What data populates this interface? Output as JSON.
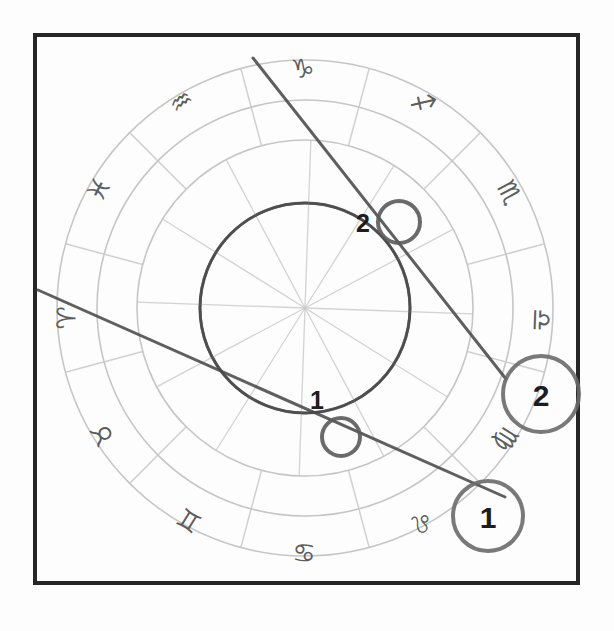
{
  "chart_data": {
    "type": "scatter",
    "subtitle": "Zodiac wheel with two aspect lines and four numbered position markers",
    "xlabel": "",
    "ylabel": "",
    "grid": true,
    "legend": "none",
    "center": {
      "x": 305,
      "y": 308
    },
    "rings": [
      {
        "name": "outer-zodiac-ring",
        "radius": 248
      },
      {
        "name": "inner-zodiac-ring",
        "radius": 208
      },
      {
        "name": "house-ring",
        "radius": 168
      },
      {
        "name": "inner-aspect-circle",
        "radius": 105
      }
    ],
    "spoke_count": 12,
    "signs": [
      {
        "name": "Capricorn",
        "glyph": "♑",
        "angle_deg": 90,
        "x": 303,
        "y": 70,
        "rotate": -5
      },
      {
        "name": "Aquarius",
        "glyph": "♒",
        "angle_deg": 120,
        "x": 182,
        "y": 103,
        "rotate": -35
      },
      {
        "name": "Pisces",
        "glyph": "♓",
        "angle_deg": 150,
        "x": 100,
        "y": 190,
        "rotate": -62
      },
      {
        "name": "Aries",
        "glyph": "♈",
        "angle_deg": 180,
        "x": 68,
        "y": 318,
        "rotate": -88
      },
      {
        "name": "Taurus",
        "glyph": "♉",
        "angle_deg": 210,
        "x": 104,
        "y": 434,
        "rotate": -118
      },
      {
        "name": "Gemini",
        "glyph": "♊",
        "angle_deg": 240,
        "x": 190,
        "y": 519,
        "rotate": -148
      },
      {
        "name": "Cancer",
        "glyph": "♋",
        "angle_deg": 270,
        "x": 304,
        "y": 551,
        "rotate": -178
      },
      {
        "name": "Leo",
        "glyph": "♌",
        "angle_deg": 300,
        "x": 421,
        "y": 521,
        "rotate": -208
      },
      {
        "name": "Virgo",
        "glyph": "♍",
        "angle_deg": 330,
        "x": 505,
        "y": 438,
        "rotate": -238
      },
      {
        "name": "Libra",
        "glyph": "♎",
        "angle_deg": 0,
        "x": 540,
        "y": 320,
        "rotate": -268
      },
      {
        "name": "Scorpio",
        "glyph": "♏",
        "angle_deg": 30,
        "x": 508,
        "y": 193,
        "rotate": -298
      },
      {
        "name": "Sagittarius",
        "glyph": "♐",
        "angle_deg": 60,
        "x": 422,
        "y": 104,
        "rotate": -328
      }
    ],
    "aspect_lines": [
      {
        "name": "aspect-line-2",
        "label": "2",
        "x1": 253,
        "y1": 58,
        "x2": 506,
        "y2": 379,
        "color": "#4a4a4a",
        "width": 3
      },
      {
        "name": "aspect-line-1",
        "label": "1",
        "x1": 38,
        "y1": 290,
        "x2": 505,
        "y2": 497,
        "color": "#4a4a4a",
        "width": 3
      }
    ],
    "orbit_arc": {
      "name": "planet-orbit-arc",
      "cx": 305,
      "cy": 308,
      "r": 105,
      "color": "#4a4a4a",
      "width": 3
    },
    "markers": [
      {
        "id": "marker-inner-2",
        "label": "2",
        "cx": 399,
        "cy": 222,
        "radius": 21,
        "label_x": 363,
        "label_y": 232,
        "font_size": 25,
        "ring_color": "#5a5a5a",
        "ring_width": 4,
        "kind": "inner"
      },
      {
        "id": "marker-outer-2",
        "label": "2",
        "cx": 541,
        "cy": 394,
        "radius": 38,
        "label_x": 541,
        "label_y": 406,
        "font_size": 30,
        "ring_color": "#6a6a6a",
        "ring_width": 4,
        "kind": "outer"
      },
      {
        "id": "marker-inner-1",
        "label": "1",
        "cx": 341,
        "cy": 437,
        "radius": 19,
        "label_x": 317,
        "label_y": 409,
        "font_size": 25,
        "ring_color": "#5a5a5a",
        "ring_width": 4,
        "kind": "inner"
      },
      {
        "id": "marker-outer-1",
        "label": "1",
        "cx": 488,
        "cy": 516,
        "radius": 35,
        "label_x": 488,
        "label_y": 528,
        "font_size": 30,
        "ring_color": "#6a6a6a",
        "ring_width": 4,
        "kind": "outer"
      }
    ],
    "colors": {
      "frame": "#262626",
      "background": "#fdfdfd",
      "ring_line": "#b8b8b8",
      "spoke_line": "#c9c9c9",
      "aspect_line": "#4a4a4a",
      "marker_ring": "#5f5f5f",
      "glyph": "#555555",
      "number": "#1d1d1d"
    },
    "frame": {
      "name": "chart-frame",
      "x": 35,
      "y": 35,
      "width": 543,
      "height": 548,
      "stroke_width": 4
    }
  }
}
